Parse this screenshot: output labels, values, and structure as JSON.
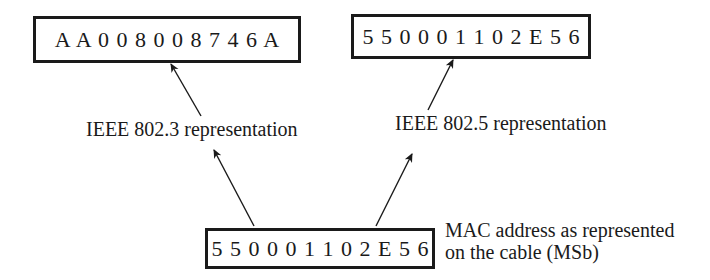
{
  "diagram": {
    "boxes": {
      "ieee_8023": {
        "value": "A A 0 0 8 0 0 8 7 4 6 A"
      },
      "ieee_8025": {
        "value": "5 5 0 0 0 1 1 0 2 E 5 6"
      },
      "cable": {
        "value": "5 5 0 0 0 1 1 0 2 E 5 6"
      }
    },
    "labels": {
      "ieee_8023": "IEEE 802.3 representation",
      "ieee_8025": "IEEE 802.5 representation",
      "cable_caption_line1": "MAC address as represented",
      "cable_caption_line2": "on the cable (MSb)"
    },
    "arrows": [
      {
        "from": "cable",
        "to": "ieee_8023",
        "icon": "arrow-up-left-icon"
      },
      {
        "from": "cable",
        "to": "ieee_8025",
        "icon": "arrow-up-right-icon"
      }
    ],
    "colors": {
      "stroke": "#1a1a1a",
      "background": "#ffffff"
    }
  }
}
